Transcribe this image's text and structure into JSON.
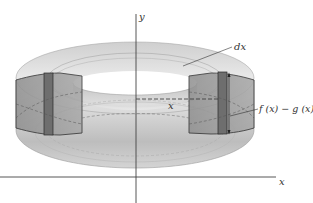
{
  "figure": {
    "type": "solid-of-revolution-shell",
    "axes": {
      "x_label": "x",
      "y_label": "y"
    },
    "labels": {
      "differential": "dx",
      "radius": "x",
      "height": "f (x) − g (x)"
    },
    "colors": {
      "background": "#ffffff",
      "solid_light": "#e6e6e6",
      "solid_mid": "#c8c8c8",
      "section_fill": "#9a9a9a",
      "strip_fill": "#6e6e6e",
      "outline": "#2a2a2a",
      "axis": "#444444"
    }
  }
}
